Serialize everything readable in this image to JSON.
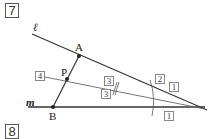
{
  "problem_numbers": {
    "current": "7",
    "next": "8"
  },
  "lines": {
    "ell": {
      "label": "ℓ"
    },
    "m": {
      "label": "m"
    }
  },
  "points": {
    "A": {
      "label": "A"
    },
    "P": {
      "label": "P"
    },
    "B": {
      "label": "B"
    }
  },
  "ratio_labels": {
    "four": "4",
    "three_upper": "3",
    "three_lower": "3",
    "two": "2",
    "one_upper": "1",
    "one_lower": "1"
  },
  "colors": {
    "line": "#333333",
    "construction_line": "#666666",
    "box_border": "#555555"
  }
}
